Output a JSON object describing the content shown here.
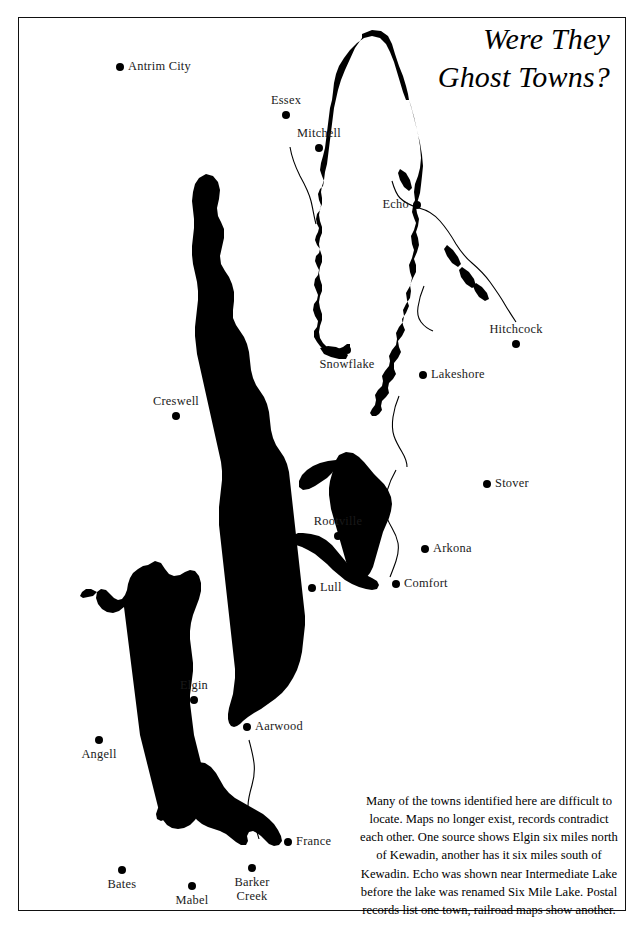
{
  "title": {
    "line1": "Were They",
    "line2": "Ghost Towns?"
  },
  "caption": {
    "text": "Many of the towns identified here are difficult to locate. Maps no longer exist, records contradict each other.  One source shows Elgin six miles north of Kewadin, another has it six miles south of Kewadin.  Echo was shown near Intermediate Lake before the lake was renamed Six Mile Lake.  Postal records list one town, railroad maps show another."
  },
  "colors": {
    "ink": "#000000",
    "water": "#000000",
    "paper": "#ffffff",
    "frame": "#111111"
  },
  "map": {
    "towns": [
      {
        "name": "Antrim City",
        "label": "Antrim City",
        "x": 120,
        "y": 67,
        "labelpos": "right"
      },
      {
        "name": "Essex",
        "label": "Essex",
        "x": 286,
        "y": 115,
        "labelpos": "above"
      },
      {
        "name": "Mitchell",
        "label": "Mitchell",
        "x": 319,
        "y": 148,
        "labelpos": "above"
      },
      {
        "name": "Echo",
        "label": "Echo",
        "x": 417,
        "y": 205,
        "labelpos": "left"
      },
      {
        "name": "Hitchcock",
        "label": "Hitchcock",
        "x": 516,
        "y": 344,
        "labelpos": "above"
      },
      {
        "name": "Snowflake",
        "label": "Snowflake",
        "x": 347,
        "y": 350,
        "labelpos": "below"
      },
      {
        "name": "Lakeshore",
        "label": "Lakeshore",
        "x": 423,
        "y": 375,
        "labelpos": "right"
      },
      {
        "name": "Creswell",
        "label": "Creswell",
        "x": 176,
        "y": 416,
        "labelpos": "above"
      },
      {
        "name": "Stover",
        "label": "Stover",
        "x": 487,
        "y": 484,
        "labelpos": "right"
      },
      {
        "name": "Rootville",
        "label": "Rootville",
        "x": 338,
        "y": 536,
        "labelpos": "above"
      },
      {
        "name": "Arkona",
        "label": "Arkona",
        "x": 425,
        "y": 549,
        "labelpos": "right"
      },
      {
        "name": "Lull",
        "label": "Lull",
        "x": 312,
        "y": 588,
        "labelpos": "right"
      },
      {
        "name": "Comfort",
        "label": "Comfort",
        "x": 396,
        "y": 584,
        "labelpos": "right"
      },
      {
        "name": "Elgin",
        "label": "Elgin",
        "x": 194,
        "y": 700,
        "labelpos": "above"
      },
      {
        "name": "Aarwood",
        "label": "Aarwood",
        "x": 247,
        "y": 727,
        "labelpos": "right"
      },
      {
        "name": "Angell",
        "label": "Angell",
        "x": 99,
        "y": 740,
        "labelpos": "below"
      },
      {
        "name": "France",
        "label": "France",
        "x": 288,
        "y": 842,
        "labelpos": "right"
      },
      {
        "name": "Bates",
        "label": "Bates",
        "x": 122,
        "y": 870,
        "labelpos": "below"
      },
      {
        "name": "Mabel",
        "label": "Mabel",
        "x": 192,
        "y": 886,
        "labelpos": "below"
      },
      {
        "name": "Barker Creek",
        "label": "Barker Creek",
        "x": 252,
        "y": 868,
        "labelpos": "below-two"
      }
    ]
  }
}
